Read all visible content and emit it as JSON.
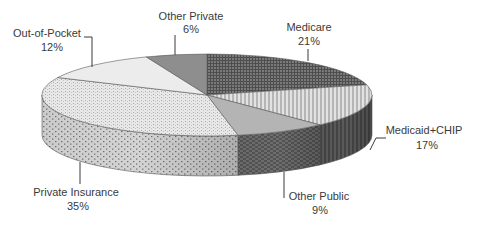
{
  "chart_data": {
    "type": "pie",
    "title": "",
    "style": "3d-exploded-none",
    "start_angle": "12 o'clock",
    "direction": "clockwise",
    "slices": [
      {
        "label": "Medicare",
        "value": 21,
        "display": "21%",
        "fill": "#6a6a6a",
        "pattern": "grid-dark",
        "label_pos": [
          304,
          26
        ],
        "leader": [
          [
            308,
            36
          ],
          [
            308,
            61
          ]
        ]
      },
      {
        "label": "Medicaid+CHIP",
        "value": 17,
        "display": "17%",
        "fill": "#cfcfcf",
        "pattern": "vertical-lines",
        "label_pos": [
          422,
          131
        ],
        "leader": [
          [
            384,
            138
          ],
          [
            374,
            138
          ],
          [
            368,
            150
          ]
        ]
      },
      {
        "label": "Other Public",
        "value": 9,
        "display": "9%",
        "fill": "#a8a8a8",
        "pattern": "solid",
        "label_pos": [
          320,
          196
        ],
        "leader": [
          [
            284,
            196
          ],
          [
            284,
            172
          ]
        ]
      },
      {
        "label": "Private Insurance",
        "value": 35,
        "display": "35%",
        "fill": "#dcdcdc",
        "pattern": "dots",
        "label_pos": [
          76,
          191
        ],
        "leader": [
          [
            80,
            181
          ],
          [
            80,
            163
          ]
        ]
      },
      {
        "label": "Out-of-Pocket",
        "value": 12,
        "display": "12%",
        "fill": "#ececec",
        "pattern": "solid-light",
        "label_pos": [
          47,
          37
        ],
        "leader": [
          [
            84,
            35
          ],
          [
            92,
            35
          ],
          [
            92,
            66
          ]
        ]
      },
      {
        "label": "Other Private",
        "value": 6,
        "display": "6%",
        "fill": "#8c8c8c",
        "pattern": "solid-mid",
        "label_pos": [
          191,
          22
        ],
        "leader": [
          [
            175,
            33
          ],
          [
            175,
            55
          ]
        ]
      }
    ],
    "legend": "none (data labels with leader lines)",
    "geometry": {
      "cx": 207,
      "cy": 95,
      "rx": 165,
      "ry": 41,
      "depth": 40
    }
  },
  "labels": {
    "medicare": {
      "name": "Medicare",
      "pct": "21%"
    },
    "medicaid": {
      "name": "Medicaid+CHIP",
      "pct": "17%"
    },
    "other_public": {
      "name": "Other Public",
      "pct": "9%"
    },
    "private_insurance": {
      "name": "Private Insurance",
      "pct": "35%"
    },
    "out_of_pocket": {
      "name": "Out-of-Pocket",
      "pct": "12%"
    },
    "other_private": {
      "name": "Other Private",
      "pct": "6%"
    }
  }
}
